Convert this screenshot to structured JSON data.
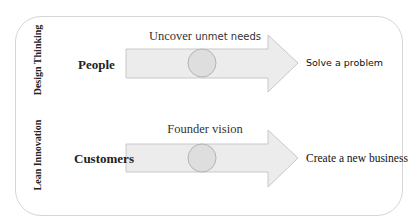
{
  "diagram": {
    "rows": [
      {
        "category": "Design Thinking",
        "source": "People",
        "caption_part1": "Uncover",
        "caption_part2": "unmet needs",
        "caption": "Uncover unmet needs",
        "target": "Solve a problem"
      },
      {
        "category": "Lean Innovation",
        "source": "Customers",
        "caption": "Founder vision",
        "target": "Create a new business"
      }
    ],
    "colors": {
      "arrow_fill": "#ececec",
      "arrow_stroke": "#c8c8c8",
      "circle_fill": "#dedede",
      "circle_stroke": "#b4b4b4",
      "frame_border": "#d6d6d6"
    }
  }
}
